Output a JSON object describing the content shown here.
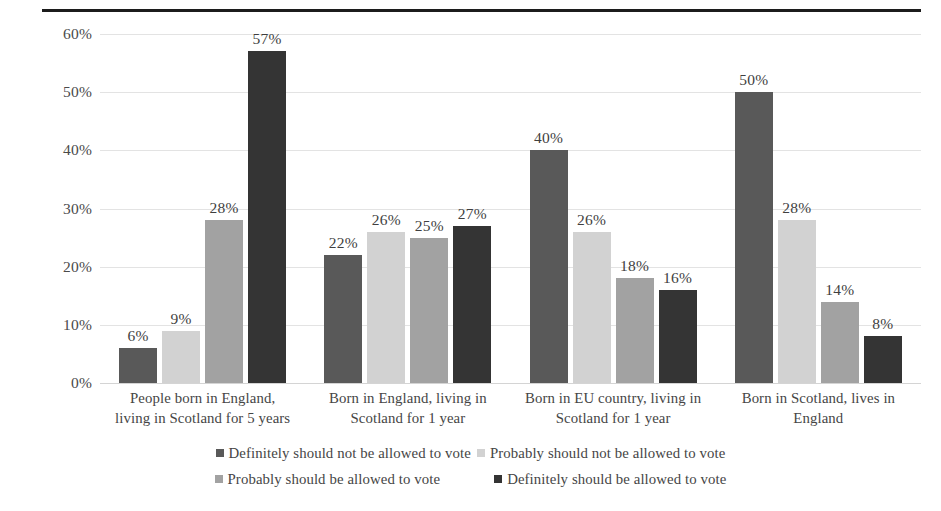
{
  "chart_data": {
    "type": "bar",
    "title": "",
    "xlabel": "",
    "ylabel": "",
    "ylim": [
      0,
      60
    ],
    "grid": true,
    "legend_position": "bottom",
    "categories": [
      "People born in England, living in Scotland for 5 years",
      "Born in England, living in Scotland for 1 year",
      "Born in EU country, living in Scotland for 1 year",
      "Born in Scotland, lives in England"
    ],
    "category_lines": [
      [
        "People born in England,",
        "living in Scotland for 5 years"
      ],
      [
        "Born in England, living in",
        "Scotland for 1 year"
      ],
      [
        "Born in EU country, living in",
        "Scotland for 1 year"
      ],
      [
        "Born in Scotland, lives in",
        "England"
      ]
    ],
    "ytick_labels": [
      "60%",
      "50%",
      "40%",
      "30%",
      "20%",
      "10%",
      "0%"
    ],
    "ytick_values": [
      60,
      50,
      40,
      30,
      20,
      10,
      0
    ],
    "series": [
      {
        "name": "Definitely should not be allowed to vote",
        "color": "#595959",
        "values": [
          6,
          22,
          40,
          50
        ],
        "labels": [
          "6%",
          "22%",
          "40%",
          "50%"
        ]
      },
      {
        "name": "Probably should not be allowed to vote",
        "color": "#d2d2d2",
        "values": [
          9,
          26,
          26,
          28
        ],
        "labels": [
          "9%",
          "26%",
          "26%",
          "28%"
        ]
      },
      {
        "name": "Probably should be allowed to vote",
        "color": "#a2a2a2",
        "values": [
          28,
          25,
          18,
          14
        ],
        "labels": [
          "28%",
          "25%",
          "18%",
          "14%"
        ]
      },
      {
        "name": "Definitely should be allowed to vote",
        "color": "#343434",
        "values": [
          57,
          27,
          16,
          8
        ],
        "labels": [
          "57%",
          "27%",
          "16%",
          "8%"
        ]
      }
    ]
  },
  "legend": {
    "rows": [
      [
        {
          "label": "Definitely should not be allowed to vote",
          "color": "#595959"
        },
        {
          "label": "Probably should not be allowed to vote",
          "color": "#d2d2d2"
        }
      ],
      [
        {
          "label": "Probably should be allowed to vote",
          "color": "#a2a2a2"
        },
        {
          "label": "Definitely should be allowed to vote",
          "color": "#343434"
        }
      ]
    ]
  }
}
